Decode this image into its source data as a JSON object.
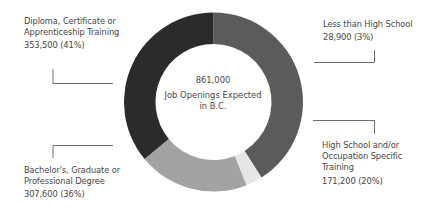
{
  "chart_data": {
    "type": "pie",
    "variant": "donut",
    "title": "",
    "center_label": {
      "total": "861,000",
      "line1": "Job Openings Expected",
      "line2": "in B.C."
    },
    "total": 861000,
    "categories": [
      "Diploma, Certificate or Apprenticeship Training",
      "Less than High School",
      "High School and/or Occupation Specific Training",
      "Bachelor's, Graduate or Professional Degree"
    ],
    "values": [
      353500,
      28900,
      171200,
      307600
    ],
    "percentages": [
      41,
      3,
      20,
      36
    ],
    "colors": [
      "#5b5b5b",
      "#e6e6e6",
      "#a3a3a3",
      "#2b2b2b"
    ],
    "start_angle_deg": 270,
    "direction": "clockwise",
    "legend_position": "callout-labels"
  },
  "labels": {
    "diploma": {
      "line1": "Diploma, Certificate or",
      "line2": "Apprenticeship Training",
      "value": "353,500 (41%)"
    },
    "less_than_hs": {
      "line1": "Less than High School",
      "value": "28,900 (3%)"
    },
    "high_school": {
      "line1": "High School and/or",
      "line2": "Occupation Specific",
      "line3": "Training",
      "value": "171,200 (20%)"
    },
    "bachelors": {
      "line1": "Bachelor's, Graduate or",
      "line2": "Professional Degree",
      "value": "307,600 (36%)"
    }
  },
  "colors": {
    "line": "#6e6e6e",
    "text": "#474747",
    "background": "#ffffff"
  }
}
